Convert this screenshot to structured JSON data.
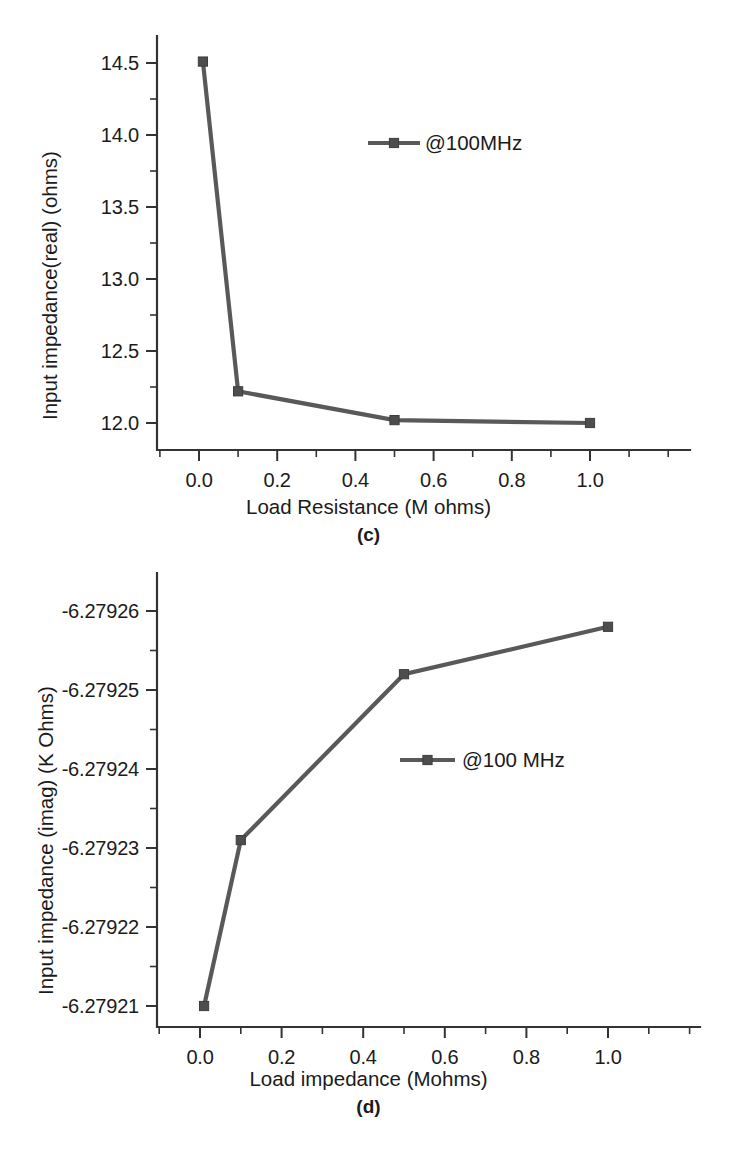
{
  "page": {
    "background": "#ffffff",
    "ink": "#1b1b1b",
    "series_color": "#595959"
  },
  "chart_data": [
    {
      "id": "c",
      "type": "line",
      "title": "",
      "panel_label": "(c)",
      "xlabel": "Load Resistance (M ohms)",
      "ylabel": "Input impedance(real) (ohms)",
      "xlim": [
        -0.09,
        1.13
      ],
      "ylim": [
        11.82,
        14.62
      ],
      "xticks": [
        0.0,
        0.2,
        0.4,
        0.6,
        0.8,
        1.0
      ],
      "xtick_labels": [
        "0.0",
        "0.2",
        "0.4",
        "0.6",
        "0.8",
        "1.0"
      ],
      "xminor_step": 0.1,
      "yticks": [
        12.0,
        12.5,
        13.0,
        13.5,
        14.0,
        14.5
      ],
      "ytick_labels": [
        "12.0",
        "12.5",
        "13.0",
        "13.5",
        "14.0",
        "14.5"
      ],
      "yminor_step": 0.25,
      "grid": false,
      "legend_position": "upper-center",
      "series": [
        {
          "name": "@100MHz",
          "marker": "square",
          "x": [
            0.01,
            0.1,
            0.5,
            1.0
          ],
          "values": [
            14.51,
            12.22,
            12.02,
            12.0
          ]
        }
      ]
    },
    {
      "id": "d",
      "type": "line",
      "title": "",
      "panel_label": "(d)",
      "xlabel": "Load impedance (Mohms)",
      "ylabel": "Input impedance (imag) (K Ohms)",
      "xlim": [
        -0.1,
        1.14
      ],
      "ylim": [
        -6.279265,
        -6.279203
      ],
      "xticks": [
        0.0,
        0.2,
        0.4,
        0.6,
        0.8,
        1.0
      ],
      "xtick_labels": [
        "0.0",
        "0.2",
        "0.4",
        "0.6",
        "0.8",
        "1.0"
      ],
      "xminor_step": 0.1,
      "yticks": [
        -6.27921,
        -6.27922,
        -6.27923,
        -6.27924,
        -6.27925,
        -6.27926
      ],
      "ytick_labels": [
        "-6.27921",
        "-6.27922",
        "-6.27923",
        "-6.27924",
        "-6.27925",
        "-6.27926"
      ],
      "yminor_step": 5e-06,
      "grid": false,
      "legend_position": "upper-center",
      "series": [
        {
          "name": "@100 MHz",
          "marker": "square",
          "x": [
            0.01,
            0.1,
            0.5,
            1.0
          ],
          "values": [
            -6.27921,
            -6.279231,
            -6.279252,
            -6.279258
          ]
        }
      ]
    }
  ],
  "caption": {
    "truncated_line": ""
  }
}
